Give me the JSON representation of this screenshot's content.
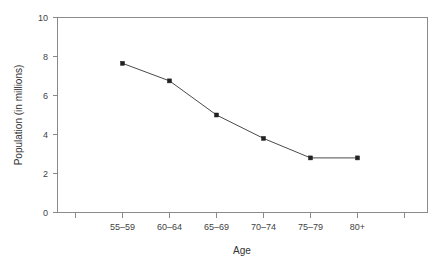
{
  "chart_data": {
    "type": "line",
    "title": "",
    "xlabel": "Age",
    "ylabel": "Population (in millions)",
    "categories": [
      "55–59",
      "60–64",
      "65–69",
      "70–74",
      "75–79",
      "80+"
    ],
    "values": [
      7.65,
      6.75,
      5.0,
      3.8,
      2.8,
      2.8
    ],
    "series": [
      {
        "name": "Population",
        "values": [
          7.65,
          6.75,
          5.0,
          3.8,
          2.8,
          2.8
        ]
      }
    ],
    "ylim": [
      0,
      10
    ],
    "yticks": [
      0,
      2,
      4,
      6,
      8,
      10
    ],
    "ytick_labels": [
      "0",
      "2",
      "4",
      "6",
      "8",
      "10"
    ],
    "grid": false,
    "legend": "none",
    "marker": "square",
    "line_color": "#4a4a4a",
    "marker_color": "#222222",
    "axis_color": "#8a8a8a",
    "background": "#ffffff",
    "edge_ticks_unlabeled": 2
  },
  "axes": {
    "y_title": "Population (in millions)",
    "x_title": "Age"
  }
}
